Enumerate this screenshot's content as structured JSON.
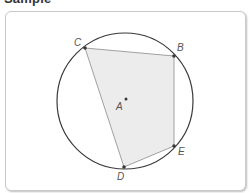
{
  "header": {
    "title": "Sample"
  },
  "diagram": {
    "circle": {
      "center_label": "A",
      "cx": 125,
      "cy": 101,
      "r": 68
    },
    "points": [
      {
        "label": "A",
        "x": 126,
        "y": 99
      },
      {
        "label": "B",
        "x": 174,
        "y": 56
      },
      {
        "label": "C",
        "x": 85,
        "y": 48
      },
      {
        "label": "D",
        "x": 124,
        "y": 167
      },
      {
        "label": "E",
        "x": 174,
        "y": 146
      }
    ],
    "polygon": [
      "C",
      "B",
      "E",
      "D"
    ],
    "colors": {
      "circle": "#3a3a3a",
      "polygon_fill": "#ececec",
      "polygon_stroke": "#8a8a8a",
      "point": "#3a3a3a"
    }
  },
  "labels": {
    "A": "A",
    "B": "B",
    "C": "C",
    "D": "D",
    "E": "E"
  }
}
